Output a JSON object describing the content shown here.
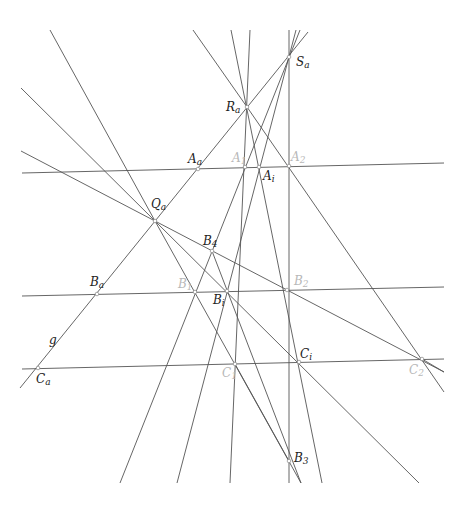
{
  "diagram": {
    "type": "projective-geometry-construction",
    "colors": {
      "line": "#555555",
      "label_dark": "#222222",
      "label_light": "#b8b8b8"
    },
    "lines": [
      {
        "name": "line-g",
        "x1": 20,
        "y1": 388,
        "x2": 308,
        "y2": 32
      },
      {
        "name": "line-a",
        "x1": 22,
        "y1": 173,
        "x2": 444,
        "y2": 163
      },
      {
        "name": "line-b",
        "x1": 22,
        "y1": 296,
        "x2": 444,
        "y2": 287
      },
      {
        "name": "line-c",
        "x1": 22,
        "y1": 369,
        "x2": 444,
        "y2": 359
      },
      {
        "name": "line-qa-1",
        "x1": 50,
        "y1": 30,
        "x2": 155,
        "y2": 221
      },
      {
        "name": "line-qa-2",
        "x1": 21,
        "y1": 88,
        "x2": 155,
        "y2": 221
      },
      {
        "name": "line-qa-3",
        "x1": 21,
        "y1": 151,
        "x2": 155,
        "y2": 221
      },
      {
        "name": "line-qa-b4-c2",
        "x1": 155,
        "y1": 221,
        "x2": 444,
        "y2": 372
      },
      {
        "name": "line-qa-b1-b3",
        "x1": 155,
        "y1": 221,
        "x2": 301,
        "y2": 483
      },
      {
        "name": "line-qa-bi-ci",
        "x1": 155,
        "y1": 221,
        "x2": 419,
        "y2": 483
      },
      {
        "name": "line-ra-top",
        "x1": 193,
        "y1": 30,
        "x2": 247,
        "y2": 107
      },
      {
        "name": "line-ra-a2-c2",
        "x1": 247,
        "y1": 107,
        "x2": 444,
        "y2": 392
      },
      {
        "name": "line-ra-ai-b3",
        "x1": 231,
        "y1": 30,
        "x2": 322,
        "y2": 483
      },
      {
        "name": "line-a1-c1",
        "x1": 250,
        "y1": 30,
        "x2": 230,
        "y2": 483
      },
      {
        "name": "line-a2-b3",
        "x1": 289,
        "y1": 30,
        "x2": 289,
        "y2": 483
      },
      {
        "name": "line-sa-b1",
        "x1": 300,
        "y1": 30,
        "x2": 120,
        "y2": 483
      },
      {
        "name": "line-sa-bi",
        "x1": 296,
        "y1": 30,
        "x2": 177,
        "y2": 483
      },
      {
        "name": "line-b4-b3",
        "x1": 212,
        "y1": 251,
        "x2": 301,
        "y2": 483
      },
      {
        "name": "line-c1-b3",
        "x1": 235,
        "y1": 364,
        "x2": 289,
        "y2": 461
      },
      {
        "name": "line-c2-out",
        "x1": 422,
        "y1": 359,
        "x2": 444,
        "y2": 372
      }
    ],
    "points": [
      {
        "name": "point-sa",
        "label": "S",
        "sub": "a",
        "x": 289,
        "y": 57,
        "lx": 296,
        "ly": 66,
        "tone": "dark"
      },
      {
        "name": "point-ra",
        "label": "R",
        "sub": "a",
        "x": 247,
        "y": 107,
        "lx": 226,
        "ly": 111,
        "tone": "dark"
      },
      {
        "name": "point-aa",
        "label": "A",
        "sub": "a",
        "x": 198,
        "y": 169,
        "lx": 188,
        "ly": 163,
        "tone": "dark"
      },
      {
        "name": "point-a1",
        "label": "A",
        "sub": "1",
        "x": 245,
        "y": 167,
        "lx": 232,
        "ly": 162,
        "tone": "light"
      },
      {
        "name": "point-ai",
        "label": "A",
        "sub": "i",
        "x": 259,
        "y": 167,
        "lx": 263,
        "ly": 180,
        "tone": "dark"
      },
      {
        "name": "point-a2",
        "label": "A",
        "sub": "2",
        "x": 289,
        "y": 166,
        "lx": 291,
        "ly": 161,
        "tone": "light"
      },
      {
        "name": "point-qa",
        "label": "Q",
        "sub": "a",
        "x": 155,
        "y": 221,
        "lx": 151,
        "ly": 208,
        "tone": "dark"
      },
      {
        "name": "point-b4",
        "label": "B",
        "sub": "4",
        "x": 212,
        "y": 251,
        "lx": 203,
        "ly": 245,
        "tone": "dark"
      },
      {
        "name": "point-ba",
        "label": "B",
        "sub": "a",
        "x": 97,
        "y": 294,
        "lx": 90,
        "ly": 286,
        "tone": "dark"
      },
      {
        "name": "point-b1",
        "label": "B",
        "sub": "1",
        "x": 195,
        "y": 292,
        "lx": 178,
        "ly": 288,
        "tone": "light"
      },
      {
        "name": "point-bi",
        "label": "B",
        "sub": "i",
        "x": 227,
        "y": 291,
        "lx": 213,
        "ly": 304,
        "tone": "dark"
      },
      {
        "name": "point-b2",
        "label": "B",
        "sub": "2",
        "x": 287,
        "y": 290,
        "lx": 294,
        "ly": 285,
        "tone": "light"
      },
      {
        "name": "point-ca",
        "label": "C",
        "sub": "a",
        "x": 38,
        "y": 368,
        "lx": 36,
        "ly": 383,
        "tone": "dark"
      },
      {
        "name": "point-c1",
        "label": "C",
        "sub": "1",
        "x": 235,
        "y": 364,
        "lx": 222,
        "ly": 377,
        "tone": "light"
      },
      {
        "name": "point-ci",
        "label": "C",
        "sub": "i",
        "x": 299,
        "y": 362,
        "lx": 300,
        "ly": 358,
        "tone": "dark"
      },
      {
        "name": "point-c2",
        "label": "C",
        "sub": "2",
        "x": 422,
        "y": 359,
        "lx": 409,
        "ly": 374,
        "tone": "light"
      },
      {
        "name": "point-b3",
        "label": "B",
        "sub": "3",
        "x": 289,
        "y": 461,
        "lx": 294,
        "ly": 462,
        "tone": "dark"
      }
    ],
    "line_labels": [
      {
        "name": "label-g",
        "text": "g",
        "x": 49,
        "y": 344
      }
    ]
  }
}
